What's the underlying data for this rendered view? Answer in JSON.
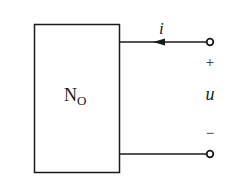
{
  "diagram": {
    "type": "circuit-one-port",
    "network": {
      "label": "N",
      "subscript": "O"
    },
    "current": {
      "label": "i",
      "direction": "into-network"
    },
    "voltage": {
      "label": "u",
      "plus": "+",
      "minus": "−"
    },
    "terminals": [
      "top-terminal",
      "bottom-terminal"
    ],
    "colors": {
      "stroke": "#1a1a1a",
      "background": "#ffffff"
    }
  }
}
